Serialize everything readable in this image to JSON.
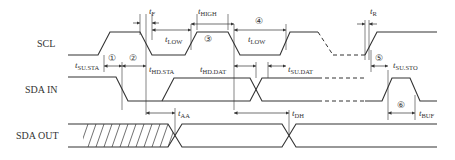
{
  "diagram": {
    "type": "I2C bus timing diagram",
    "signals": [
      {
        "id": "scl",
        "label": "SCL"
      },
      {
        "id": "sda_in",
        "label": "SDA IN"
      },
      {
        "id": "sda_out",
        "label": "SDA OUT"
      }
    ],
    "timing_params": [
      {
        "id": "t_f",
        "main": "t",
        "sub": "F"
      },
      {
        "id": "t_high",
        "main": "t",
        "sub": "HIGH"
      },
      {
        "id": "t_low_1",
        "main": "t",
        "sub": "LOW"
      },
      {
        "id": "t_low_2",
        "main": "t",
        "sub": "LOW"
      },
      {
        "id": "t_r",
        "main": "t",
        "sub": "R"
      },
      {
        "id": "t_su_sta",
        "main": "t",
        "sub": "SU.STA"
      },
      {
        "id": "t_hd_sta",
        "main": "t",
        "sub": "HD.STA"
      },
      {
        "id": "t_hd_dat",
        "main": "t",
        "sub": "HD.DAT"
      },
      {
        "id": "t_su_dat",
        "main": "t",
        "sub": "SU.DAT"
      },
      {
        "id": "t_su_sto",
        "main": "t",
        "sub": "SU.STO"
      },
      {
        "id": "t_aa",
        "main": "t",
        "sub": "AA"
      },
      {
        "id": "t_dh",
        "main": "t",
        "sub": "DH"
      },
      {
        "id": "t_buf",
        "main": "t",
        "sub": "BUF"
      }
    ],
    "markers": [
      "①",
      "②",
      "③",
      "④",
      "⑤",
      "⑥"
    ]
  }
}
